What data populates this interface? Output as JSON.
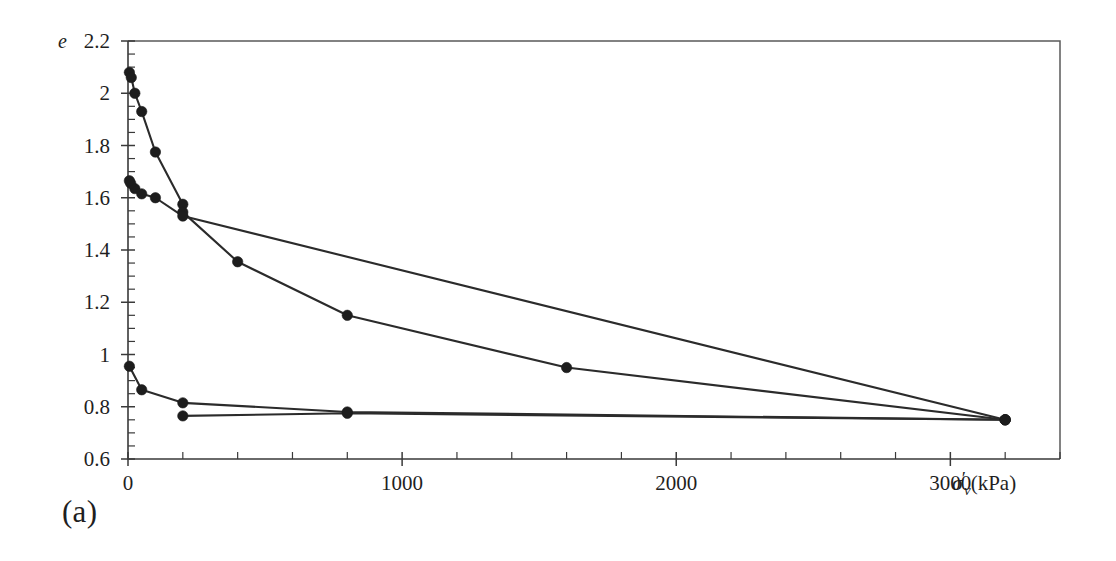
{
  "figure": {
    "panel_label": "(a)",
    "background_color": "#ffffff",
    "line_color": "#2b2b2b",
    "marker_color": "#1d1d1d",
    "axis_color": "#3a3a3a"
  },
  "chart_data": {
    "type": "line",
    "title": "",
    "subtitle": "",
    "panel_label": "(a)",
    "xlabel": "σ'ᵥ (kPa)",
    "xlabel_parts": {
      "symbol": "σ",
      "prime": "′",
      "subscript": "v",
      "units": "(kPa)"
    },
    "ylabel": "e",
    "xlim": [
      0,
      3400
    ],
    "ylim": [
      0.6,
      2.2
    ],
    "grid": false,
    "legend": null,
    "x_ticks": [
      0,
      1000,
      2000,
      3000
    ],
    "x_tick_labels": [
      "0",
      "1000",
      "2000",
      "3000"
    ],
    "x_minor_tick_step": 200,
    "y_ticks": [
      0.6,
      0.8,
      1.0,
      1.2,
      1.4,
      1.6,
      1.8,
      2.0,
      2.2
    ],
    "y_tick_labels": [
      "0.6",
      "0.8",
      "1",
      "1.2",
      "1.4",
      "1.6",
      "1.8",
      "2",
      "2.2"
    ],
    "y_minor_tick_step": 0.05,
    "marker": "filled-circle",
    "series": [
      {
        "name": "specimen-1-loading",
        "points": [
          [
            5,
            2.08
          ],
          [
            12,
            2.06
          ],
          [
            25,
            2.0
          ],
          [
            50,
            1.93
          ],
          [
            100,
            1.775
          ],
          [
            200,
            1.575
          ],
          [
            200,
            1.545
          ],
          [
            400,
            1.355
          ],
          [
            800,
            1.15
          ],
          [
            1600,
            0.95
          ],
          [
            3200,
            0.75
          ]
        ]
      },
      {
        "name": "specimen-1-unloading",
        "points": [
          [
            3200,
            0.75
          ],
          [
            200,
            1.53
          ],
          [
            100,
            1.6
          ],
          [
            50,
            1.615
          ],
          [
            25,
            1.635
          ],
          [
            10,
            1.655
          ],
          [
            5,
            1.665
          ]
        ]
      },
      {
        "name": "specimen-2-loading",
        "points": [
          [
            5,
            0.955
          ],
          [
            50,
            0.865
          ],
          [
            200,
            0.815
          ],
          [
            800,
            0.78
          ],
          [
            3200,
            0.75
          ]
        ]
      },
      {
        "name": "specimen-2-unloading",
        "points": [
          [
            3200,
            0.75
          ],
          [
            800,
            0.775
          ],
          [
            200,
            0.765
          ]
        ]
      }
    ],
    "annotations": []
  },
  "axes_geometry": {
    "plot_left_px": 128,
    "plot_right_px": 1060,
    "plot_top_px": 41,
    "plot_bottom_px": 459
  }
}
